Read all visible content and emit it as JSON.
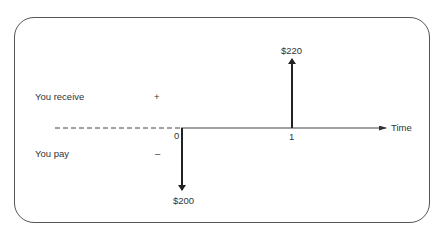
{
  "diagram": {
    "type": "cash-flow-timeline",
    "row_labels": {
      "receive": "You receive",
      "pay": "You pay"
    },
    "signs": {
      "positive": "+",
      "negative": "–"
    },
    "axis": {
      "label": "Time",
      "ticks": [
        "0",
        "1"
      ]
    },
    "cash_flows": [
      {
        "time": "0",
        "direction": "pay",
        "amount_label": "$200",
        "amount": -200
      },
      {
        "time": "1",
        "direction": "receive",
        "amount_label": "$220",
        "amount": 220
      }
    ]
  }
}
